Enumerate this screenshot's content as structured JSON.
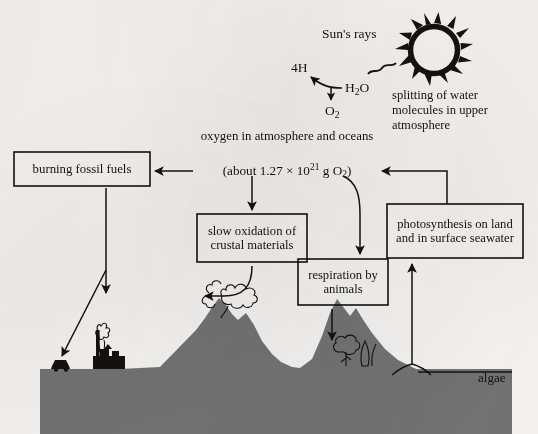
{
  "diagram": {
    "background_color": "#f5f4f2",
    "ink_color": "#15110e",
    "terrain_color": "#737373"
  },
  "sun": {
    "rays_label": "Sun's rays",
    "icon": "sun-icon"
  },
  "photolysis": {
    "product_hydrogen": "4H",
    "reactant_water_prefix": "H",
    "reactant_water_sub": "2",
    "reactant_water_suffix": "O",
    "product_oxygen_prefix": "O",
    "product_oxygen_sub": "2",
    "caption": "splitting of water molecules in upper atmosphere"
  },
  "reservoir": {
    "label": "oxygen in atmosphere and oceans",
    "mass_prefix": "(about 1.27 × 10",
    "mass_exponent": "21",
    "mass_middle": " g O",
    "mass_sub": "2",
    "mass_suffix": ")"
  },
  "boxes": [
    {
      "id": "burning-fossil-fuels",
      "label": "burning fossil fuels"
    },
    {
      "id": "slow-oxidation",
      "label": "slow oxidation of crustal materials"
    },
    {
      "id": "respiration",
      "label": "respiration by animals"
    },
    {
      "id": "photosynthesis",
      "label": "photosynthesis on land and in surface seawater"
    }
  ],
  "landscape": {
    "algae_label": "algae",
    "features": [
      "car-icon",
      "factory-icon",
      "smokestack-plume-icon",
      "volcano-icon",
      "volcano-plume-icon",
      "tree-icon",
      "sea-surface-line"
    ]
  }
}
